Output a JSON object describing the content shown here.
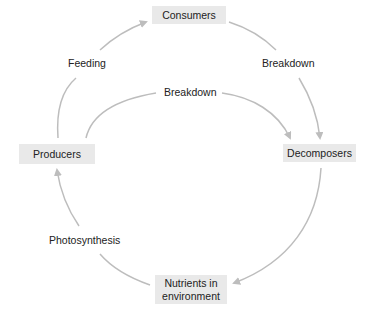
{
  "nodes": {
    "consumers": "Consumers",
    "producers": "Producers",
    "decomposers": "Decomposers",
    "nutrients_line1": "Nutrients in",
    "nutrients_line2": "environment"
  },
  "edges": {
    "feeding": "Feeding",
    "breakdown_consumers": "Breakdown",
    "breakdown_producers": "Breakdown",
    "photosynthesis": "Photosynthesis"
  },
  "colors": {
    "arrow": "#bdbdbd",
    "node_fill": "#e9e9e9"
  }
}
